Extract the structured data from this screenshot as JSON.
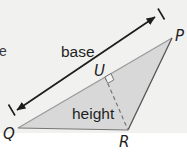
{
  "figure": {
    "type": "geometry-diagram",
    "labels": {
      "base": "base",
      "height": "height"
    },
    "vertices": {
      "P": "P",
      "Q": "Q",
      "R": "R",
      "U": "U"
    },
    "cutoff_text": "e",
    "colors": {
      "background": "#f1f1ef",
      "bottom_strip": "#ffffff",
      "triangle_fill": "#d8d8d8",
      "base_edge": "#9c9c9c",
      "bottom_edge": "#767676",
      "right_edge": "#555555",
      "dashed_height_line": "#777777",
      "arrow": "#1c1c1c",
      "text": "#1f1f1f"
    }
  }
}
